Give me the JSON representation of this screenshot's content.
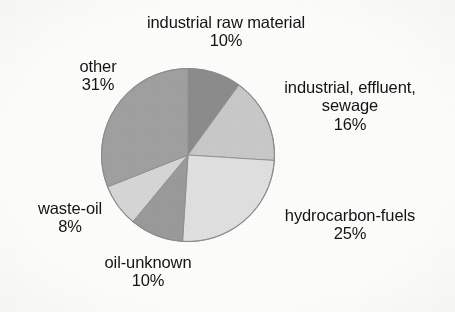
{
  "chart_data": {
    "type": "pie",
    "title": "",
    "subtitle": "",
    "xlabel": "",
    "ylabel": "",
    "legend_position": "labels-outside",
    "grid": false,
    "units": "percent",
    "total": 100,
    "start_angle_deg": 0,
    "direction": "clockwise",
    "categories": [
      "industrial raw material",
      "industrial, effluent, sewage",
      "hydrocarbon-fuels",
      "oil-unknown",
      "waste-oil",
      "other"
    ],
    "values": [
      10,
      16,
      25,
      10,
      8,
      31
    ],
    "value_labels": [
      "10%",
      "16%",
      "25%",
      "10%",
      "8%",
      "31%"
    ],
    "colors": [
      "#8c8c8c",
      "#c9c9c9",
      "#e0e0e0",
      "#9a9a9a",
      "#d6d6d6",
      "#a0a0a0"
    ],
    "slices": [
      {
        "name": "industrial raw material",
        "value": 10,
        "label": "industrial raw material",
        "pct_label": "10%",
        "color": "#8c8c8c",
        "start_deg": 0,
        "end_deg": 36
      },
      {
        "name": "industrial, effluent, sewage",
        "value": 16,
        "label_line1": "industrial, effluent,",
        "label_line2": "sewage",
        "pct_label": "16%",
        "color": "#c9c9c9",
        "start_deg": 36,
        "end_deg": 93.6
      },
      {
        "name": "hydrocarbon-fuels",
        "value": 25,
        "label": "hydrocarbon-fuels",
        "pct_label": "25%",
        "color": "#e0e0e0",
        "start_deg": 93.6,
        "end_deg": 183.6
      },
      {
        "name": "oil-unknown",
        "value": 10,
        "label": "oil-unknown",
        "pct_label": "10%",
        "color": "#9a9a9a",
        "start_deg": 183.6,
        "end_deg": 219.6
      },
      {
        "name": "waste-oil",
        "value": 8,
        "label": "waste-oil",
        "pct_label": "8%",
        "color": "#d6d6d6",
        "start_deg": 219.6,
        "end_deg": 248.4
      },
      {
        "name": "other",
        "value": 31,
        "label": "other",
        "pct_label": "31%",
        "color": "#a0a0a0",
        "start_deg": 248.4,
        "end_deg": 360
      }
    ]
  },
  "labels": {
    "industrial_raw_material": {
      "name": "industrial raw material",
      "pct": "10%"
    },
    "industrial_effluent_sewage": {
      "line1": "industrial, effluent,",
      "line2": "sewage",
      "pct": "16%"
    },
    "hydrocarbon_fuels": {
      "name": "hydrocarbon-fuels",
      "pct": "25%"
    },
    "oil_unknown": {
      "name": "oil-unknown",
      "pct": "10%"
    },
    "waste_oil": {
      "name": "waste-oil",
      "pct": "8%"
    },
    "other": {
      "name": "other",
      "pct": "31%"
    }
  },
  "style": {
    "background": "#fdfdfc",
    "text_color": "#141414",
    "outline_color": "#8a8a8a"
  }
}
